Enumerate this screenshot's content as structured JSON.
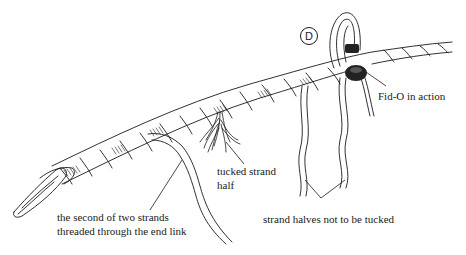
{
  "figure": {
    "step_marker": "D",
    "colors": {
      "ink": "#1a1a1a",
      "background": "#ffffff",
      "fid_o": "#222222"
    },
    "callouts": {
      "fid_o": "Fid-O in action",
      "tucked_strand_line1": "tucked strand",
      "tucked_strand_line2": "half",
      "strand_halves": "strand halves not to be tucked",
      "second_strand_line1": "the second of two strands",
      "second_strand_line2": "threaded through the end link"
    },
    "icons": {
      "rope": "twisted-rope-illustration",
      "chain_link": "end-link-illustration",
      "fid_o_tool": "fid-o-tool-illustration",
      "frayed_strand": "frayed-strand-illustration"
    }
  }
}
